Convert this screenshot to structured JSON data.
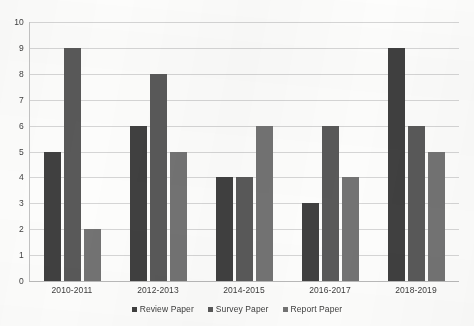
{
  "chart_data": {
    "type": "bar",
    "title": "",
    "xlabel": "",
    "ylabel": "",
    "ylim": [
      0,
      10
    ],
    "y_ticks": [
      10,
      9,
      8,
      7,
      6,
      5,
      4,
      3,
      2,
      1,
      0
    ],
    "grid": true,
    "legend_position": "bottom",
    "categories": [
      "2010-2011",
      "2012-2013",
      "2014-2015",
      "2016-2017",
      "2018-2019"
    ],
    "series": [
      {
        "name": "Review Paper",
        "color": "#404040",
        "values": [
          5,
          6,
          4,
          3,
          9
        ]
      },
      {
        "name": "Survey Paper",
        "color": "#595959",
        "values": [
          9,
          8,
          4,
          6,
          6
        ]
      },
      {
        "name": "Report Paper",
        "color": "#737373",
        "values": [
          2,
          5,
          6,
          4,
          5
        ]
      }
    ]
  }
}
